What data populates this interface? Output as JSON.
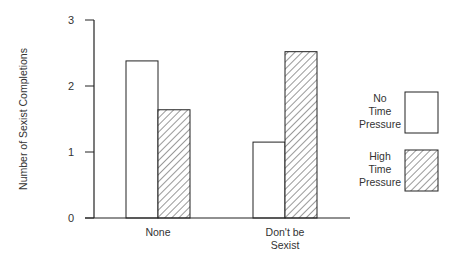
{
  "chart_data": {
    "type": "bar",
    "title": "",
    "xlabel": "",
    "ylabel": "Number of Sexist Completions",
    "ylim": [
      0,
      3
    ],
    "yticks": [
      "0",
      "1",
      "2",
      "3"
    ],
    "grid": false,
    "legend_position": "right",
    "categories": [
      "None",
      "Don't be Sexist"
    ],
    "category_lines": [
      [
        "None"
      ],
      [
        "Don't be",
        "Sexist"
      ]
    ],
    "series": [
      {
        "name": "No Time Pressure",
        "label_lines": [
          "No",
          "Time",
          "Pressure"
        ],
        "fill": "white",
        "values": [
          2.38,
          1.15
        ]
      },
      {
        "name": "High Time Pressure",
        "label_lines": [
          "High",
          "Time",
          "Pressure"
        ],
        "fill": "hatched",
        "values": [
          1.64,
          2.52
        ]
      }
    ]
  },
  "colors": {
    "stroke": "#222222",
    "background": "#ffffff"
  }
}
